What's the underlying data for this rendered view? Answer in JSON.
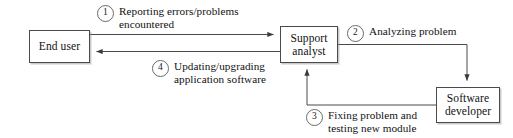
{
  "diagram": {
    "background_color": "#ffffff",
    "stroke_color": "#4a4a4a",
    "text_color": "#111111",
    "nodes": [
      {
        "id": "end-user",
        "label": "End user"
      },
      {
        "id": "support",
        "label": "Support\nanalyst"
      },
      {
        "id": "developer",
        "label": "Software\ndeveloper"
      }
    ],
    "steps": [
      {
        "number": "1",
        "text": "Reporting errors/problems\nencountered",
        "from": "End user",
        "to": "Support analyst"
      },
      {
        "number": "2",
        "text": "Analyzing problem",
        "from": "Support analyst",
        "to": "Software developer"
      },
      {
        "number": "3",
        "text": "Fixing problem and\ntesting new module",
        "from": "Software developer",
        "to": "Support analyst"
      },
      {
        "number": "4",
        "text": "Updating/upgrading\napplication software",
        "from": "Support analyst",
        "to": "End user"
      }
    ]
  }
}
